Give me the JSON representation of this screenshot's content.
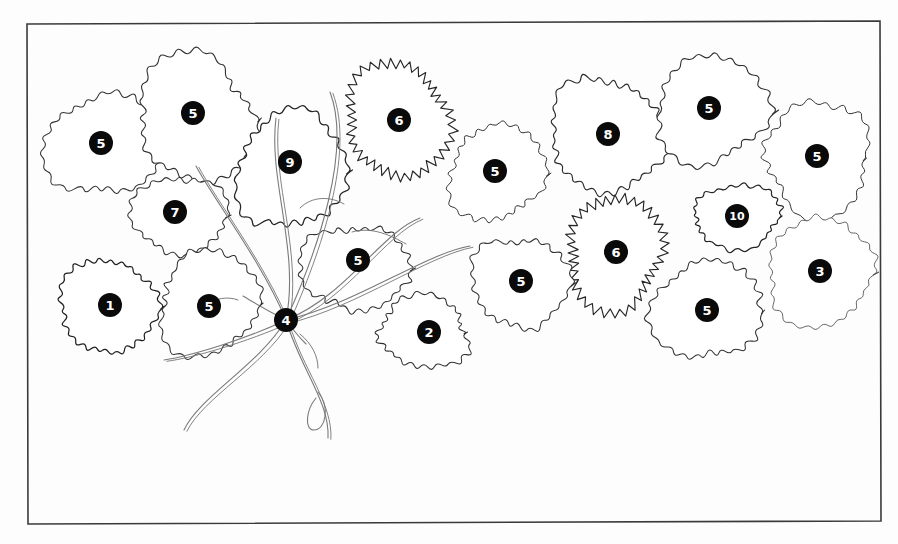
{
  "figure": {
    "frame": {
      "color": "#3a3a3a",
      "stroke_width": 1.6,
      "x": 27,
      "y": 22,
      "width": 853,
      "height": 502,
      "skew_note": "scanned, slightly rotated"
    },
    "background_color": "#fdfdfd",
    "crown_line_color": "#2b2b2b",
    "crown_fill_color": "#ffffff",
    "marker_fill_color": "#0a0a0a",
    "marker_text_color": "#ffffff",
    "vine_line_color": "#6e6e6e"
  },
  "markers": [
    {
      "id": "m01",
      "label": "5",
      "cx": 101,
      "cy": 143,
      "r": 12,
      "font_size": 13
    },
    {
      "id": "m02",
      "label": "5",
      "cx": 193,
      "cy": 113,
      "r": 12,
      "font_size": 13
    },
    {
      "id": "m03",
      "label": "9",
      "cx": 290,
      "cy": 162,
      "r": 12,
      "font_size": 13
    },
    {
      "id": "m04",
      "label": "6",
      "cx": 399,
      "cy": 120,
      "r": 12,
      "font_size": 13
    },
    {
      "id": "m05",
      "label": "5",
      "cx": 495,
      "cy": 171,
      "r": 12,
      "font_size": 13
    },
    {
      "id": "m06",
      "label": "8",
      "cx": 608,
      "cy": 134,
      "r": 12,
      "font_size": 13
    },
    {
      "id": "m07",
      "label": "5",
      "cx": 709,
      "cy": 108,
      "r": 12,
      "font_size": 13
    },
    {
      "id": "m08",
      "label": "5",
      "cx": 817,
      "cy": 156,
      "r": 12,
      "font_size": 13
    },
    {
      "id": "m09",
      "label": "7",
      "cx": 175,
      "cy": 212,
      "r": 12,
      "font_size": 13
    },
    {
      "id": "m10",
      "label": "10",
      "cx": 737,
      "cy": 216,
      "r": 12,
      "font_size": 11
    },
    {
      "id": "m11",
      "label": "5",
      "cx": 358,
      "cy": 260,
      "r": 12,
      "font_size": 13
    },
    {
      "id": "m12",
      "label": "6",
      "cx": 616,
      "cy": 252,
      "r": 12,
      "font_size": 13
    },
    {
      "id": "m13",
      "label": "5",
      "cx": 521,
      "cy": 281,
      "r": 12,
      "font_size": 13
    },
    {
      "id": "m14",
      "label": "3",
      "cx": 820,
      "cy": 271,
      "r": 12,
      "font_size": 13
    },
    {
      "id": "m15",
      "label": "1",
      "cx": 110,
      "cy": 305,
      "r": 12,
      "font_size": 13
    },
    {
      "id": "m16",
      "label": "5",
      "cx": 209,
      "cy": 306,
      "r": 12,
      "font_size": 13
    },
    {
      "id": "m17",
      "label": "4",
      "cx": 286,
      "cy": 320,
      "r": 12,
      "font_size": 13
    },
    {
      "id": "m18",
      "label": "2",
      "cx": 429,
      "cy": 332,
      "r": 12,
      "font_size": 13
    },
    {
      "id": "m19",
      "label": "5",
      "cx": 707,
      "cy": 310,
      "r": 12,
      "font_size": 13
    }
  ],
  "crowns": [
    {
      "id": "c01",
      "marker": "m01",
      "cx": 105,
      "cy": 145,
      "rx": 58,
      "ry": 52,
      "style": "crenulate",
      "amplitude": 4.0,
      "lobes": 46,
      "stroke": 1.05,
      "color": "#353535"
    },
    {
      "id": "c02",
      "marker": "m02",
      "cx": 196,
      "cy": 118,
      "rx": 60,
      "ry": 62,
      "style": "crenulate",
      "amplitude": 4.4,
      "lobes": 48,
      "stroke": 1.1,
      "color": "#303030"
    },
    {
      "id": "c03",
      "marker": "m03",
      "cx": 291,
      "cy": 170,
      "rx": 54,
      "ry": 60,
      "style": "crenulate",
      "amplitude": 4.6,
      "lobes": 46,
      "stroke": 1.25,
      "color": "#242424"
    },
    {
      "id": "c04",
      "marker": "m04",
      "cx": 398,
      "cy": 120,
      "rx": 52,
      "ry": 55,
      "style": "serrate",
      "amplitude": 4.4,
      "lobes": 74,
      "stroke": 1.15,
      "color": "#262626"
    },
    {
      "id": "c05",
      "marker": "m05",
      "cx": 496,
      "cy": 173,
      "rx": 47,
      "ry": 49,
      "style": "crenulate",
      "amplitude": 4.4,
      "lobes": 44,
      "stroke": 1.0,
      "color": "#343434"
    },
    {
      "id": "c06",
      "marker": "m06",
      "cx": 607,
      "cy": 135,
      "rx": 58,
      "ry": 56,
      "style": "crenulate",
      "amplitude": 5.0,
      "lobes": 52,
      "stroke": 1.15,
      "color": "#2a2a2a"
    },
    {
      "id": "c07",
      "marker": "m07",
      "cx": 711,
      "cy": 110,
      "rx": 54,
      "ry": 55,
      "style": "crenulate",
      "amplitude": 4.6,
      "lobes": 42,
      "stroke": 1.1,
      "color": "#2e2e2e"
    },
    {
      "id": "c08",
      "marker": "m08",
      "cx": 818,
      "cy": 158,
      "rx": 56,
      "ry": 53,
      "style": "crenulate",
      "amplitude": 4.4,
      "lobes": 44,
      "stroke": 1.0,
      "color": "#343434"
    },
    {
      "id": "c09",
      "marker": "m09",
      "cx": 180,
      "cy": 215,
      "rx": 46,
      "ry": 40,
      "style": "crenulate",
      "amplitude": 4.0,
      "lobes": 40,
      "stroke": 1.05,
      "color": "#333333"
    },
    {
      "id": "c10",
      "marker": "m10",
      "cx": 737,
      "cy": 216,
      "rx": 46,
      "ry": 30,
      "style": "crenulate",
      "amplitude": 3.4,
      "lobes": 44,
      "stroke": 1.2,
      "color": "#232323"
    },
    {
      "id": "c11",
      "marker": "m11",
      "cx": 355,
      "cy": 268,
      "rx": 52,
      "ry": 44,
      "style": "crenulate",
      "amplitude": 4.2,
      "lobes": 46,
      "stroke": 1.05,
      "color": "#313131"
    },
    {
      "id": "c12",
      "marker": "m12",
      "cx": 615,
      "cy": 253,
      "rx": 50,
      "ry": 52,
      "style": "serrate",
      "amplitude": 4.4,
      "lobes": 72,
      "stroke": 1.15,
      "color": "#262626"
    },
    {
      "id": "c13",
      "marker": "m13",
      "cx": 520,
      "cy": 282,
      "rx": 46,
      "ry": 48,
      "style": "crenulate",
      "amplitude": 4.4,
      "lobes": 42,
      "stroke": 1.05,
      "color": "#313131"
    },
    {
      "id": "c14",
      "marker": "m14",
      "cx": 820,
      "cy": 272,
      "rx": 54,
      "ry": 52,
      "style": "crenulate",
      "amplitude": 3.6,
      "lobes": 46,
      "stroke": 0.85,
      "color": "#4a4a4a"
    },
    {
      "id": "c15",
      "marker": "m15",
      "cx": 108,
      "cy": 306,
      "rx": 47,
      "ry": 48,
      "style": "crenulate",
      "amplitude": 4.2,
      "lobes": 50,
      "stroke": 1.25,
      "color": "#202020"
    },
    {
      "id": "c16",
      "marker": "m16",
      "cx": 209,
      "cy": 303,
      "rx": 52,
      "ry": 50,
      "style": "crenulate",
      "amplitude": 4.2,
      "lobes": 46,
      "stroke": 1.05,
      "color": "#313131"
    },
    {
      "id": "c18",
      "marker": "m18",
      "cx": 424,
      "cy": 332,
      "rx": 47,
      "ry": 34,
      "style": "crenulate",
      "amplitude": 4.0,
      "lobes": 44,
      "stroke": 1.05,
      "color": "#313131"
    },
    {
      "id": "c19",
      "marker": "m19",
      "cx": 707,
      "cy": 310,
      "rx": 52,
      "ry": 52,
      "style": "crenulate",
      "amplitude": 4.6,
      "lobes": 46,
      "stroke": 1.05,
      "color": "#2f2f2f"
    }
  ],
  "vine": {
    "origin_marker": "m17",
    "origin_x": 286,
    "origin_y": 320,
    "color": "#7a7a7a",
    "stroke_width": 1.1,
    "branch_count": 9,
    "description": "liana / climber stem system radiating from point 4"
  },
  "legend_note": {
    "present": false
  }
}
